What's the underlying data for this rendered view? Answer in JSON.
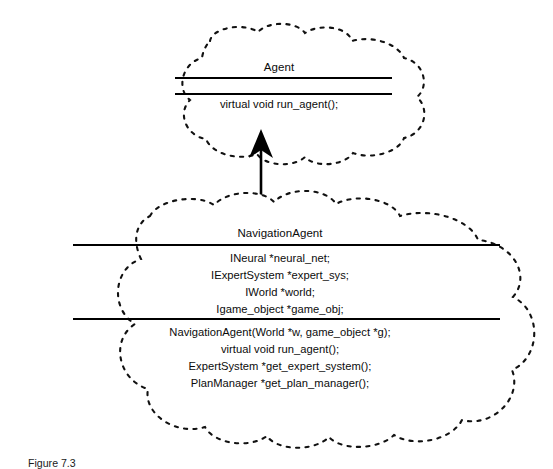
{
  "diagram": {
    "type": "uml-class-inheritance",
    "notation": "cloud-shaped class boxes with dashed outlines",
    "relationship": {
      "name": "generalization-arrow",
      "from": "NavigationAgent",
      "to": "Agent",
      "arrow_style": "solid-line-closed-filled-arrowhead",
      "direction": "up"
    },
    "classes": [
      {
        "id": "agent",
        "name": "Agent",
        "attributes": [],
        "methods": [
          "virtual void run_agent();"
        ]
      },
      {
        "id": "navigation_agent",
        "name": "NavigationAgent",
        "attributes": [
          "INeural *neural_net;",
          "IExpertSystem *expert_sys;",
          "IWorld *world;",
          "Igame_object *game_obj;"
        ],
        "methods": [
          "NavigationAgent(World *w, game_object *g);",
          "virtual void run_agent();",
          "ExpertSystem *get_expert_system();",
          "PlanManager *get_plan_manager();"
        ]
      }
    ]
  },
  "caption": {
    "text": "Figure 7.3"
  },
  "colors": {
    "ink": "#000000",
    "background": "#ffffff",
    "outline": "#111111"
  }
}
